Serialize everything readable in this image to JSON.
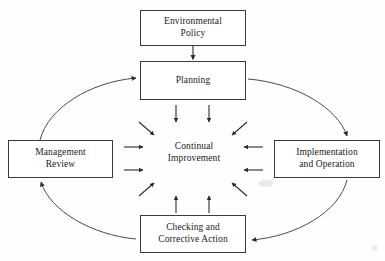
{
  "diagram": {
    "background_color": "#fefefe",
    "stroke_color": "#3a3a3a",
    "text_color": "#1a1a1a",
    "center": {
      "line1": "Continual",
      "line2": "Improvement"
    },
    "boxes": [
      {
        "id": "policy",
        "line1": "Environmental",
        "line2": "Policy"
      },
      {
        "id": "planning",
        "line1": "Planning",
        "line2": ""
      },
      {
        "id": "mgmt",
        "line1": "Management",
        "line2": "Review"
      },
      {
        "id": "impl",
        "line1": "Implementation",
        "line2": "and Operation"
      },
      {
        "id": "checking",
        "line1": "Checking and",
        "line2": "Corrective Action"
      }
    ],
    "connectors": [
      {
        "id": "policy-to-planning",
        "kind": "straight-arrow",
        "from": "policy",
        "to": "planning"
      },
      {
        "id": "mgmt-to-planning",
        "kind": "curved-arrow",
        "from": "mgmt",
        "to": "planning"
      },
      {
        "id": "planning-to-impl",
        "kind": "curved-arrow",
        "from": "planning",
        "to": "impl"
      },
      {
        "id": "impl-to-checking",
        "kind": "curved-arrow",
        "from": "impl",
        "to": "checking"
      },
      {
        "id": "checking-to-mgmt",
        "kind": "curved-arrow",
        "from": "checking",
        "to": "mgmt"
      }
    ],
    "inward_arrows_count": 12
  }
}
